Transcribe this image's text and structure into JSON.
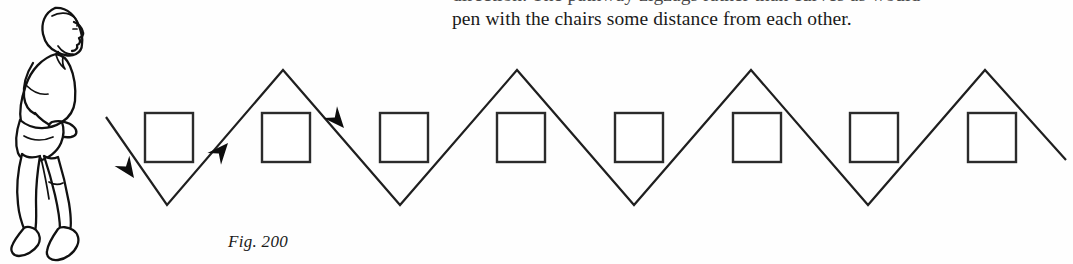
{
  "page": {
    "background": "#fefefe",
    "width": 1073,
    "height": 264
  },
  "body_text": {
    "line_1_clipped": "direction. The pathway zigzags rather than curves as would",
    "line_2": "pen with the chairs some distance from each other."
  },
  "figure": {
    "caption": "Fig. 200",
    "illustration_name": "walking-man-profile",
    "ink_color": "#1b1b1b",
    "chair_count": 8,
    "arrow_count": 3,
    "chairs": [
      {
        "x": 145,
        "y": 113,
        "size": 48
      },
      {
        "x": 262,
        "y": 113,
        "size": 48
      },
      {
        "x": 380,
        "y": 113,
        "size": 48
      },
      {
        "x": 497,
        "y": 113,
        "size": 48
      },
      {
        "x": 615,
        "y": 113,
        "size": 48
      },
      {
        "x": 733,
        "y": 113,
        "size": 48
      },
      {
        "x": 850,
        "y": 113,
        "size": 48
      },
      {
        "x": 968,
        "y": 113,
        "size": 48
      }
    ],
    "zigzag": {
      "peak_y": 70,
      "valley_y": 205,
      "start_x": 106,
      "start_y": 117,
      "end_x": 1066,
      "end_y": 160,
      "period": 117
    },
    "arrows": [
      {
        "name": "arrow-down-right-1",
        "x": 134,
        "y": 178,
        "angle": 49
      },
      {
        "name": "arrow-up-right-2",
        "x": 224,
        "y": 140,
        "angle": -49
      },
      {
        "name": "arrow-down-right-3",
        "x": 340,
        "y": 124,
        "angle": 49
      }
    ]
  }
}
